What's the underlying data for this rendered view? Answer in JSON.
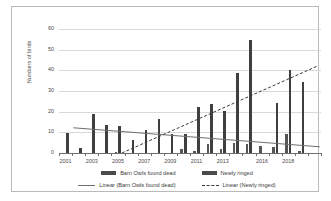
{
  "chart_data": {
    "type": "bar",
    "title": "",
    "xlabel": "",
    "ylabel": "Numbers of birds",
    "ylim": [
      0,
      60
    ],
    "yticks": [
      0,
      10,
      20,
      30,
      40,
      50,
      60
    ],
    "grid": true,
    "legend_position": "bottom",
    "categories": [
      "2001",
      "2002",
      "2003",
      "2004",
      "2005",
      "2006",
      "2007",
      "2008",
      "2009",
      "2010",
      "2011",
      "2012",
      "2013",
      "2014",
      "2015",
      "2016",
      "2017",
      "2018",
      "2019",
      "2020"
    ],
    "xtick_labels": [
      "2001",
      "2003",
      "2005",
      "2007",
      "2009",
      "2011",
      "2013",
      "2016",
      "2018"
    ],
    "xtick_label_positions": [
      0,
      2,
      4,
      6,
      8,
      10,
      12,
      15,
      17
    ],
    "series": [
      {
        "name": "Barn Owls found dead",
        "color": "#555555",
        "values": [
          0,
          0,
          0,
          0,
          0.5,
          0,
          0,
          0,
          0,
          2,
          1.2,
          4.3,
          2,
          4.8,
          4.2,
          3.5,
          3,
          9,
          1.1,
          0
        ]
      },
      {
        "name": "Newly ringed",
        "color": "#3f3f3f",
        "values": [
          9.6,
          2.6,
          18.7,
          13.4,
          13.3,
          6.2,
          11.2,
          16.6,
          9.4,
          9.4,
          22.2,
          23.6,
          20.4,
          38.6,
          54.6,
          0,
          24.4,
          40.4,
          34.2,
          0
        ]
      }
    ],
    "trendlines": [
      {
        "name": "Linear (Barn Owls found dead)",
        "style": "solid",
        "color": "#6e6e6e",
        "start_value": 12.2,
        "end_value": 3.0,
        "start_category_index": 0.6,
        "end_category_index": 19.4
      },
      {
        "name": "Linear (Newly ringed)",
        "style": "dashed",
        "color": "#3a3a3a",
        "start_value": 0.0,
        "end_value": 42.0,
        "start_category_index": 4.3,
        "end_category_index": 19.2
      }
    ],
    "legend": [
      {
        "label": "Barn Owls found dead",
        "marker": "bar-swatch",
        "color": "#4a4a4a"
      },
      {
        "label": "Newly ringed",
        "marker": "bar-swatch",
        "color": "#3f3f3f"
      },
      {
        "label": "Linear (Barn Owls found dead)",
        "marker": "solid-line",
        "color": "#6e6e6e"
      },
      {
        "label": "Linear (Newly ringed)",
        "marker": "dashed-line",
        "color": "#3a3a3a"
      }
    ]
  }
}
